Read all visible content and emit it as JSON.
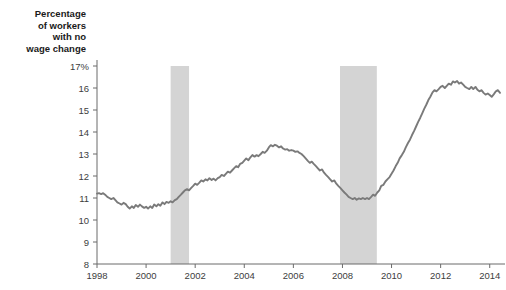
{
  "chart_data": {
    "type": "line",
    "title": "Percentage\nof workers\nwith no\nwage change",
    "xlabel": "",
    "ylabel": "Percentage of workers with no wage change",
    "xlim": [
      1998,
      2014.5
    ],
    "ylim": [
      8,
      17
    ],
    "grid": false,
    "legend": "none",
    "y_ticks": [
      {
        "value": 17,
        "label": "17%"
      },
      {
        "value": 16,
        "label": "16"
      },
      {
        "value": 15,
        "label": "15"
      },
      {
        "value": 14,
        "label": "14"
      },
      {
        "value": 13,
        "label": "13"
      },
      {
        "value": 12,
        "label": "12"
      },
      {
        "value": 11,
        "label": "11"
      },
      {
        "value": 10,
        "label": "10"
      },
      {
        "value": 9,
        "label": "9"
      },
      {
        "value": 8,
        "label": "8"
      }
    ],
    "x_ticks": [
      {
        "value": 1998,
        "label": "1998"
      },
      {
        "value": 2000,
        "label": "2000"
      },
      {
        "value": 2002,
        "label": "2002"
      },
      {
        "value": 2004,
        "label": "2004"
      },
      {
        "value": 2006,
        "label": "2006"
      },
      {
        "value": 2008,
        "label": "2008"
      },
      {
        "value": 2010,
        "label": "2010"
      },
      {
        "value": 2012,
        "label": "2012"
      },
      {
        "value": 2014,
        "label": "2014"
      }
    ],
    "recession_bands": [
      {
        "name": "recession-2001",
        "start": 2001.0,
        "end": 2001.75
      },
      {
        "name": "recession-2008",
        "start": 2007.9,
        "end": 2009.4
      }
    ],
    "colors": {
      "line": "#7a7a7a",
      "band": "#d4d4d4",
      "axis": "#6b6b6b",
      "text": "#3d3d3d",
      "title": "#1a1a1a",
      "background": "#ffffff"
    },
    "series": [
      {
        "name": "Percentage of workers with no wage change",
        "x": [
          1998.0,
          1998.08,
          1998.17,
          1998.25,
          1998.33,
          1998.42,
          1998.5,
          1998.58,
          1998.67,
          1998.75,
          1998.83,
          1998.92,
          1999.0,
          1999.08,
          1999.17,
          1999.25,
          1999.33,
          1999.42,
          1999.5,
          1999.58,
          1999.67,
          1999.75,
          1999.83,
          1999.92,
          2000.0,
          2000.08,
          2000.17,
          2000.25,
          2000.33,
          2000.42,
          2000.5,
          2000.58,
          2000.67,
          2000.75,
          2000.83,
          2000.92,
          2001.0,
          2001.08,
          2001.17,
          2001.25,
          2001.33,
          2001.42,
          2001.5,
          2001.58,
          2001.67,
          2001.75,
          2001.83,
          2001.92,
          2002.0,
          2002.08,
          2002.17,
          2002.25,
          2002.33,
          2002.42,
          2002.5,
          2002.58,
          2002.67,
          2002.75,
          2002.83,
          2002.92,
          2003.0,
          2003.08,
          2003.17,
          2003.25,
          2003.33,
          2003.42,
          2003.5,
          2003.58,
          2003.67,
          2003.75,
          2003.83,
          2003.92,
          2004.0,
          2004.08,
          2004.17,
          2004.25,
          2004.33,
          2004.42,
          2004.5,
          2004.58,
          2004.67,
          2004.75,
          2004.83,
          2004.92,
          2005.0,
          2005.08,
          2005.17,
          2005.25,
          2005.33,
          2005.42,
          2005.5,
          2005.58,
          2005.67,
          2005.75,
          2005.83,
          2005.92,
          2006.0,
          2006.08,
          2006.17,
          2006.25,
          2006.33,
          2006.42,
          2006.5,
          2006.58,
          2006.67,
          2006.75,
          2006.83,
          2006.92,
          2007.0,
          2007.08,
          2007.17,
          2007.25,
          2007.33,
          2007.42,
          2007.5,
          2007.58,
          2007.67,
          2007.75,
          2007.83,
          2007.92,
          2008.0,
          2008.08,
          2008.17,
          2008.25,
          2008.33,
          2008.42,
          2008.5,
          2008.58,
          2008.67,
          2008.75,
          2008.83,
          2008.92,
          2009.0,
          2009.08,
          2009.17,
          2009.25,
          2009.33,
          2009.42,
          2009.5,
          2009.58,
          2009.67,
          2009.75,
          2009.83,
          2009.92,
          2010.0,
          2010.08,
          2010.17,
          2010.25,
          2010.33,
          2010.42,
          2010.5,
          2010.58,
          2010.67,
          2010.75,
          2010.83,
          2010.92,
          2011.0,
          2011.08,
          2011.17,
          2011.25,
          2011.33,
          2011.42,
          2011.5,
          2011.58,
          2011.67,
          2011.75,
          2011.83,
          2011.92,
          2012.0,
          2012.08,
          2012.17,
          2012.25,
          2012.33,
          2012.42,
          2012.5,
          2012.58,
          2012.67,
          2012.75,
          2012.83,
          2012.92,
          2013.0,
          2013.08,
          2013.17,
          2013.25,
          2013.33,
          2013.42,
          2013.5,
          2013.58,
          2013.67,
          2013.75,
          2013.83,
          2013.92,
          2014.0,
          2014.08,
          2014.17,
          2014.25,
          2014.33,
          2014.42
        ],
        "values": [
          11.2,
          11.22,
          11.18,
          11.22,
          11.15,
          11.05,
          11.0,
          10.95,
          11.0,
          10.9,
          10.8,
          10.75,
          10.7,
          10.78,
          10.72,
          10.6,
          10.52,
          10.62,
          10.55,
          10.68,
          10.6,
          10.7,
          10.62,
          10.55,
          10.6,
          10.52,
          10.62,
          10.55,
          10.7,
          10.62,
          10.72,
          10.65,
          10.8,
          10.72,
          10.82,
          10.78,
          10.85,
          10.8,
          10.9,
          10.95,
          11.05,
          11.15,
          11.25,
          11.35,
          11.4,
          11.35,
          11.45,
          11.55,
          11.65,
          11.6,
          11.7,
          11.8,
          11.75,
          11.85,
          11.8,
          11.9,
          11.82,
          11.88,
          11.8,
          11.9,
          11.95,
          12.05,
          12.0,
          12.1,
          12.2,
          12.15,
          12.25,
          12.35,
          12.45,
          12.4,
          12.55,
          12.6,
          12.7,
          12.8,
          12.72,
          12.85,
          12.95,
          12.88,
          12.95,
          12.9,
          13.0,
          13.1,
          13.05,
          13.15,
          13.3,
          13.4,
          13.35,
          13.42,
          13.38,
          13.3,
          13.35,
          13.25,
          13.2,
          13.22,
          13.15,
          13.18,
          13.15,
          13.1,
          13.12,
          13.05,
          13.0,
          12.9,
          12.8,
          12.7,
          12.6,
          12.65,
          12.55,
          12.45,
          12.35,
          12.25,
          12.3,
          12.15,
          12.05,
          11.95,
          11.85,
          11.75,
          11.8,
          11.65,
          11.55,
          11.45,
          11.35,
          11.25,
          11.15,
          11.05,
          11.0,
          10.95,
          11.0,
          10.92,
          10.98,
          10.95,
          11.0,
          10.95,
          11.0,
          10.95,
          11.05,
          11.15,
          11.1,
          11.25,
          11.35,
          11.55,
          11.6,
          11.75,
          11.85,
          11.95,
          12.1,
          12.25,
          12.45,
          12.6,
          12.8,
          12.95,
          13.1,
          13.3,
          13.5,
          13.65,
          13.85,
          14.05,
          14.25,
          14.45,
          14.65,
          14.85,
          15.05,
          15.25,
          15.45,
          15.6,
          15.8,
          15.9,
          15.85,
          15.95,
          16.05,
          16.1,
          16.0,
          16.1,
          16.2,
          16.15,
          16.3,
          16.25,
          16.32,
          16.2,
          16.25,
          16.15,
          16.05,
          16.0,
          15.95,
          16.05,
          15.95,
          16.05,
          15.92,
          15.85,
          15.9,
          15.78,
          15.7,
          15.75,
          15.68,
          15.6,
          15.72,
          15.85,
          15.9,
          15.78
        ]
      }
    ]
  }
}
